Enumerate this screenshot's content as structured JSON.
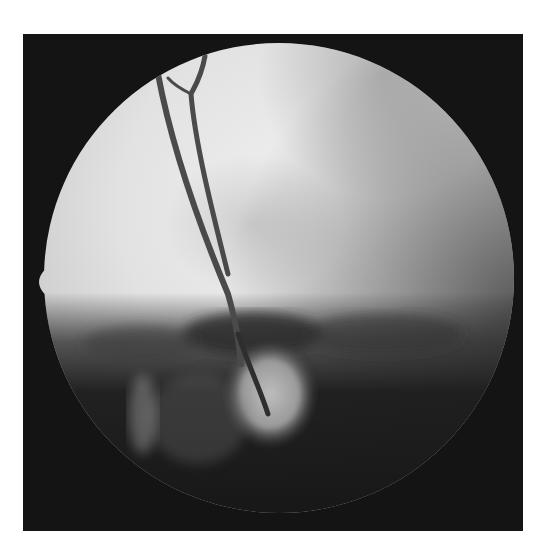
{
  "image": {
    "description": "Grayscale fundus photograph showing a circular field of view on a black square background, with two retinal blood vessels descending toward a mottled optic-disc region in the lower center and dark lower periphery.",
    "colors": {
      "page_background": "#ffffff",
      "frame_background": "#141414",
      "bright_retina": "#e6e6e6",
      "mid_retina": "#c8c8c8",
      "vessel": "#4a4a4a",
      "dark_region": "#1e1e1e"
    },
    "field_of_view": {
      "center_x": 279,
      "center_y": 278,
      "radius": 235,
      "notch": {
        "x": 29,
        "y": 282
      }
    }
  }
}
